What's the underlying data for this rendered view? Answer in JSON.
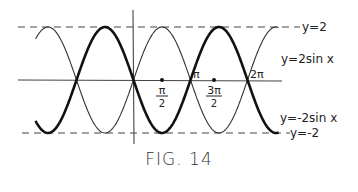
{
  "caption": "FIG. 14",
  "chart_data": {
    "type": "line",
    "title": "",
    "xlabel": "",
    "ylabel": "",
    "xlim": [
      -5.5,
      8.2
    ],
    "ylim": [
      -2.6,
      2.6
    ],
    "grid": false,
    "legend_position": "inline-right",
    "x_ticks": [
      {
        "value": 1.5708,
        "label_num": "π",
        "label_den": "2"
      },
      {
        "value": 3.1416,
        "label": "π"
      },
      {
        "value": 4.7124,
        "label_num": "3π",
        "label_den": "2"
      },
      {
        "value": 6.2832,
        "label": "2π"
      }
    ],
    "reference_lines": [
      {
        "name": "y=2",
        "y": 2,
        "style": "dashed",
        "label": "y=2"
      },
      {
        "name": "y=-2",
        "y": -2,
        "style": "dashed",
        "label": "y=-2"
      }
    ],
    "series": [
      {
        "name": "y=2sin x",
        "label": "y=2sin x",
        "function": "2*sin(x)",
        "weight": "thin",
        "x_range": [
          -5.4,
          8.0
        ]
      },
      {
        "name": "y=-2sin x",
        "label": "y=-2sin x",
        "function": "-2*sin(x)",
        "weight": "thick",
        "x_range": [
          -5.4,
          8.0
        ]
      }
    ]
  },
  "labels": {
    "y_eq_2": "y=2",
    "y_eq_neg2": "y=-2",
    "pos_curve": "y=2sin x",
    "neg_curve": "y=-2sin x",
    "pi": "π",
    "two_pi": "2π",
    "pi_over_2_num": "π",
    "pi_over_2_den": "2",
    "three_pi_over_2_num": "3π",
    "three_pi_over_2_den": "2"
  }
}
